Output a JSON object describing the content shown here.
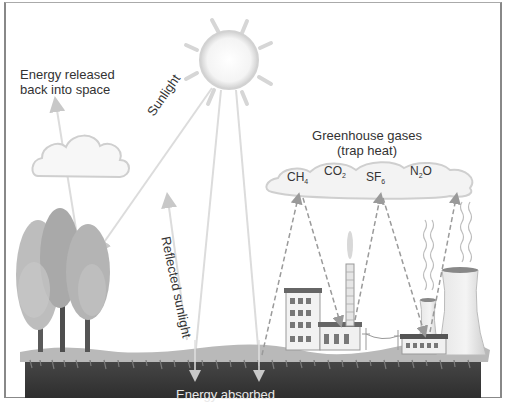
{
  "diagram": {
    "labels": {
      "energy_released": [
        "Energy released",
        "back into space"
      ],
      "sunlight": "Sunlight",
      "reflected_sunlight": "Reflected sunlight",
      "greenhouse_gases": [
        "Greenhouse gases",
        "(trap heat)"
      ],
      "energy_absorbed": "Energy absorbed"
    },
    "gases": [
      {
        "base": "CH",
        "sub": "4",
        "suffix": ""
      },
      {
        "base": "CO",
        "sub": "2",
        "suffix": ""
      },
      {
        "base": "SF",
        "sub": "6",
        "suffix": ""
      },
      {
        "base": "N",
        "sub": "2",
        "suffix": "O"
      }
    ],
    "elements": [
      "sun",
      "cloud",
      "greenhouse-gas-cloud",
      "trees",
      "factory",
      "power-plant",
      "cooling-towers",
      "ground"
    ],
    "colors": {
      "ground": "#3a3a3a",
      "grass": "#b8b8b8",
      "arrow": "#c8c8c8",
      "text": "#333333"
    }
  }
}
